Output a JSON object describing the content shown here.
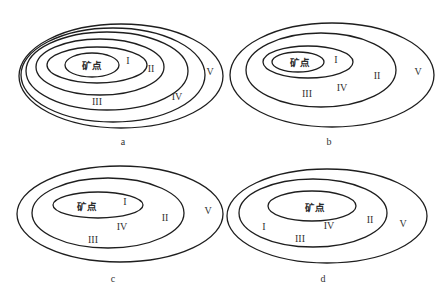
{
  "figure": {
    "width": 447,
    "height": 302,
    "line_color": "#1e1e1e",
    "text_color": "#333333",
    "background": "#ffffff"
  },
  "panels": [
    {
      "id": "a",
      "caption": "a",
      "caption_pos": [
        123,
        143
      ],
      "ellipses": [
        {
          "cx": 92,
          "cy": 65,
          "rx": 27,
          "ry": 12
        },
        {
          "cx": 97,
          "cy": 65,
          "rx": 50,
          "ry": 18
        },
        {
          "cx": 100,
          "cy": 67,
          "rx": 64,
          "ry": 28
        },
        {
          "cx": 107,
          "cy": 71,
          "rx": 81,
          "ry": 39
        },
        {
          "cx": 113,
          "cy": 75,
          "rx": 92,
          "ry": 47
        },
        {
          "cx": 121,
          "cy": 76,
          "rx": 102,
          "ry": 52
        }
      ],
      "labels": [
        {
          "text": "矿点",
          "x": 92,
          "y": 66,
          "kind": "ore"
        },
        {
          "text": "I",
          "x": 128,
          "y": 62,
          "kind": "zone"
        },
        {
          "text": "II",
          "x": 151,
          "y": 70,
          "kind": "zone"
        },
        {
          "text": "III",
          "x": 97,
          "y": 103,
          "kind": "zone"
        },
        {
          "text": "IV",
          "x": 177,
          "y": 98,
          "kind": "zone"
        },
        {
          "text": "V",
          "x": 210,
          "y": 73,
          "kind": "zone"
        }
      ]
    },
    {
      "id": "b",
      "caption": "b",
      "caption_pos": [
        329,
        143
      ],
      "ellipses": [
        {
          "cx": 298,
          "cy": 62,
          "rx": 26,
          "ry": 10
        },
        {
          "cx": 308,
          "cy": 62,
          "rx": 45,
          "ry": 16
        },
        {
          "cx": 321,
          "cy": 70,
          "rx": 75,
          "ry": 37
        },
        {
          "cx": 332,
          "cy": 75,
          "rx": 102,
          "ry": 52
        }
      ],
      "labels": [
        {
          "text": "矿点",
          "x": 300,
          "y": 63,
          "kind": "ore"
        },
        {
          "text": "I",
          "x": 336,
          "y": 61,
          "kind": "zone"
        },
        {
          "text": "II",
          "x": 377,
          "y": 77,
          "kind": "zone"
        },
        {
          "text": "III",
          "x": 307,
          "y": 95,
          "kind": "zone"
        },
        {
          "text": "IV",
          "x": 342,
          "y": 89,
          "kind": "zone"
        },
        {
          "text": "V",
          "x": 418,
          "y": 73,
          "kind": "zone"
        }
      ]
    },
    {
      "id": "c",
      "caption": "c",
      "caption_pos": [
        113,
        280
      ],
      "ellipses": [
        {
          "cx": 98,
          "cy": 205,
          "rx": 45,
          "ry": 13
        },
        {
          "cx": 108,
          "cy": 213,
          "rx": 76,
          "ry": 35
        },
        {
          "cx": 120,
          "cy": 214,
          "rx": 103,
          "ry": 48
        }
      ],
      "labels": [
        {
          "text": "矿点",
          "x": 87,
          "y": 207,
          "kind": "ore"
        },
        {
          "text": "I",
          "x": 125,
          "y": 203,
          "kind": "zone"
        },
        {
          "text": "II",
          "x": 165,
          "y": 219,
          "kind": "zone"
        },
        {
          "text": "III",
          "x": 93,
          "y": 241,
          "kind": "zone"
        },
        {
          "text": "IV",
          "x": 122,
          "y": 228,
          "kind": "zone"
        },
        {
          "text": "V",
          "x": 208,
          "y": 212,
          "kind": "zone"
        }
      ]
    },
    {
      "id": "d",
      "caption": "d",
      "caption_pos": [
        323,
        280
      ],
      "ellipses": [
        {
          "cx": 312,
          "cy": 206,
          "rx": 44,
          "ry": 15
        },
        {
          "cx": 313,
          "cy": 213,
          "rx": 74,
          "ry": 34
        },
        {
          "cx": 327,
          "cy": 216,
          "rx": 100,
          "ry": 47
        }
      ],
      "labels": [
        {
          "text": "矿点",
          "x": 315,
          "y": 208,
          "kind": "ore"
        },
        {
          "text": "I",
          "x": 264,
          "y": 228,
          "kind": "zone"
        },
        {
          "text": "II",
          "x": 370,
          "y": 221,
          "kind": "zone"
        },
        {
          "text": "III",
          "x": 300,
          "y": 240,
          "kind": "zone"
        },
        {
          "text": "IV",
          "x": 329,
          "y": 227,
          "kind": "zone"
        },
        {
          "text": "V",
          "x": 403,
          "y": 225,
          "kind": "zone"
        }
      ]
    }
  ]
}
